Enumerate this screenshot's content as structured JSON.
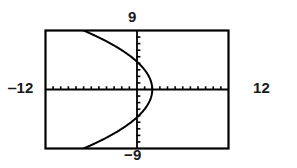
{
  "chart_data": {
    "type": "line",
    "title": "",
    "subtitle": "",
    "xlabel": "",
    "ylabel": "",
    "grid": false,
    "legend": null,
    "legend_position": "none",
    "xlim": [
      -12,
      12
    ],
    "ylim": [
      -9,
      9
    ],
    "xscl": 1,
    "yscl": 1,
    "axis_ticks": true,
    "window_labels": {
      "xmin": "‒12",
      "xmax": "12",
      "ymax": "9",
      "ymin": "−9"
    },
    "tick_labels": {
      "x": [
        -12,
        -11,
        -10,
        -9,
        -8,
        -7,
        -6,
        -5,
        -4,
        -3,
        -2,
        -1,
        0,
        1,
        2,
        3,
        4,
        5,
        6,
        7,
        8,
        9,
        10,
        11,
        12
      ],
      "y": [
        -9,
        -8,
        -7,
        -6,
        -5,
        -4,
        -3,
        -2,
        -1,
        0,
        1,
        2,
        3,
        4,
        5,
        6,
        7,
        8,
        9
      ]
    },
    "series": [
      {
        "name": "sideways parabola",
        "equation": "x = 2 - y^2/9",
        "vertex": [
          2,
          0
        ],
        "opens": "left",
        "color": "#000000",
        "points": [
          [
            -12,
            11.22
          ],
          [
            -12,
            -11.22
          ],
          [
            -10.4,
            10.52
          ],
          [
            -8.8,
            9.79
          ],
          [
            -7.2,
            9.0
          ],
          [
            -5.6,
            8.15
          ],
          [
            -4.0,
            7.35
          ],
          [
            -2.4,
            6.26
          ],
          [
            -0.8,
            5.02
          ],
          [
            0.4,
            3.79
          ],
          [
            1.2,
            2.68
          ],
          [
            1.7,
            1.64
          ],
          [
            1.9,
            0.95
          ],
          [
            2.0,
            0.0
          ],
          [
            1.9,
            -0.95
          ],
          [
            1.7,
            -1.64
          ],
          [
            1.2,
            -2.68
          ],
          [
            0.4,
            -3.79
          ],
          [
            -0.8,
            -5.02
          ],
          [
            -2.4,
            -6.26
          ],
          [
            -4.0,
            -7.35
          ],
          [
            -5.6,
            -8.15
          ],
          [
            -7.2,
            -9.0
          ],
          [
            -8.8,
            -9.79
          ],
          [
            -10.4,
            -10.52
          ],
          [
            -12,
            -11.22
          ]
        ]
      }
    ],
    "colors": {
      "curve": "#000000",
      "axis": "#000000",
      "frame": "#000000",
      "background": "#ffffff",
      "label": "#1a1a1a"
    }
  }
}
